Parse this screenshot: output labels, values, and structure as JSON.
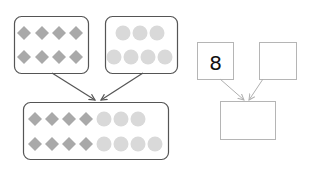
{
  "diagram": {
    "colors": {
      "diamond": "#a9a9a9",
      "circle": "#d9d9d9",
      "group_border": "#555555",
      "bond_border": "#b5b5b5",
      "arrow_left": "#555555",
      "arrow_right": "#b0b0b0",
      "number_text": "#111111"
    },
    "left_groups": [
      {
        "name": "diamond-group",
        "shape": "diamond",
        "count": 8,
        "rows": [
          4,
          4
        ]
      },
      {
        "name": "circle-group",
        "shape": "circle",
        "count": 7,
        "rows": [
          3,
          4
        ]
      }
    ],
    "combined_group": {
      "name": "combined-group",
      "rows": [
        {
          "diamonds": 4,
          "circles": 3
        },
        {
          "diamonds": 4,
          "circles": 4
        }
      ]
    },
    "number_bond": {
      "part1": "8",
      "part2": "",
      "whole": ""
    }
  }
}
